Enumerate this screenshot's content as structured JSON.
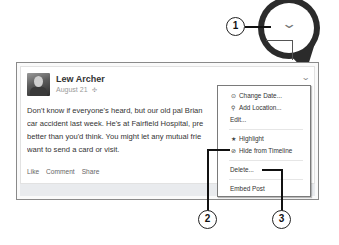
{
  "post": {
    "author": "Lew Archer",
    "date": "August 21",
    "audience_icon": "globe-icon",
    "body_lines": [
      "Don't know if everyone's heard, but our old pal Brian",
      "car accident last week. He's at Fairfield Hospital, pre",
      "better than you'd think. You might let any mutual frie",
      "want to send a card or visit."
    ],
    "actions": [
      "Like",
      "Comment",
      "Share"
    ],
    "menu_chevron": "chevron-down-icon"
  },
  "menu": {
    "items": [
      {
        "label": "Change Date...",
        "icon": "clock-icon"
      },
      {
        "label": "Add Location...",
        "icon": "location-pin-icon"
      },
      {
        "label": "Edit...",
        "icon": ""
      },
      {
        "label": "Highlight",
        "icon": "star-icon"
      },
      {
        "label": "Hide from Timeline",
        "icon": "hide-icon"
      },
      {
        "label": "Delete...",
        "icon": ""
      },
      {
        "label": "Embed Post",
        "icon": ""
      }
    ]
  },
  "callouts": {
    "one": "1",
    "two": "2",
    "three": "3"
  },
  "glyphs": {
    "chevron": "⌄",
    "globe": "✣",
    "clock": "⊙",
    "pin": "⚲",
    "star": "★",
    "hide": "⊘"
  }
}
